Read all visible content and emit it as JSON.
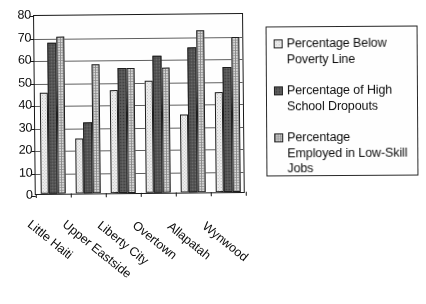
{
  "chart_data": {
    "type": "bar",
    "title": "",
    "subtitle": "",
    "xlabel": "",
    "ylabel": "",
    "ylim": [
      0,
      80
    ],
    "ytick_step": 10,
    "ytick_labels": [
      "80",
      "70",
      "60",
      "50",
      "40",
      "30",
      "20",
      "10",
      "0"
    ],
    "grid": true,
    "legend_position": "right",
    "categories": [
      "Little Haiti",
      "Upper Eastside",
      "Liberty City",
      "Overtown",
      "Allapatah",
      "Wynwood"
    ],
    "series": [
      {
        "name": "Percentage Below Poverty Line",
        "legend_label_line1": "Percentage Below",
        "legend_label_line2": "Poverty Line",
        "pattern": "light-stipple",
        "color": "#EEEEEE",
        "values": [
          45,
          24.5,
          46,
          50,
          34.5,
          44.5
        ]
      },
      {
        "name": "Percentage of High School Dropouts",
        "legend_label_line1": "Percentage of High",
        "legend_label_line2": "School Dropouts",
        "pattern": "dark-solid",
        "color": "#575757",
        "values": [
          67,
          31.5,
          55.5,
          61,
          64.5,
          55.5
        ]
      },
      {
        "name": "Percentage Employed in Low-Skill Jobs",
        "legend_label_line1": "Percentage",
        "legend_label_line2": "Employed in Low-Skill",
        "legend_label_line3": "Jobs",
        "pattern": "grid-checker",
        "color": "#D6D6D6",
        "values": [
          70,
          57.5,
          55.5,
          55.5,
          72,
          69
        ]
      }
    ]
  },
  "legend": {
    "entries": [
      {
        "swatch": "legend-swatch-poverty",
        "lines": [
          "Percentage Below",
          "Poverty Line"
        ]
      },
      {
        "swatch": "legend-swatch-dropouts",
        "lines": [
          "Percentage of High",
          "School Dropouts"
        ]
      },
      {
        "swatch": "legend-swatch-lowskill",
        "lines": [
          "Percentage",
          "Employed in Low-Skill",
          "Jobs"
        ]
      }
    ]
  }
}
